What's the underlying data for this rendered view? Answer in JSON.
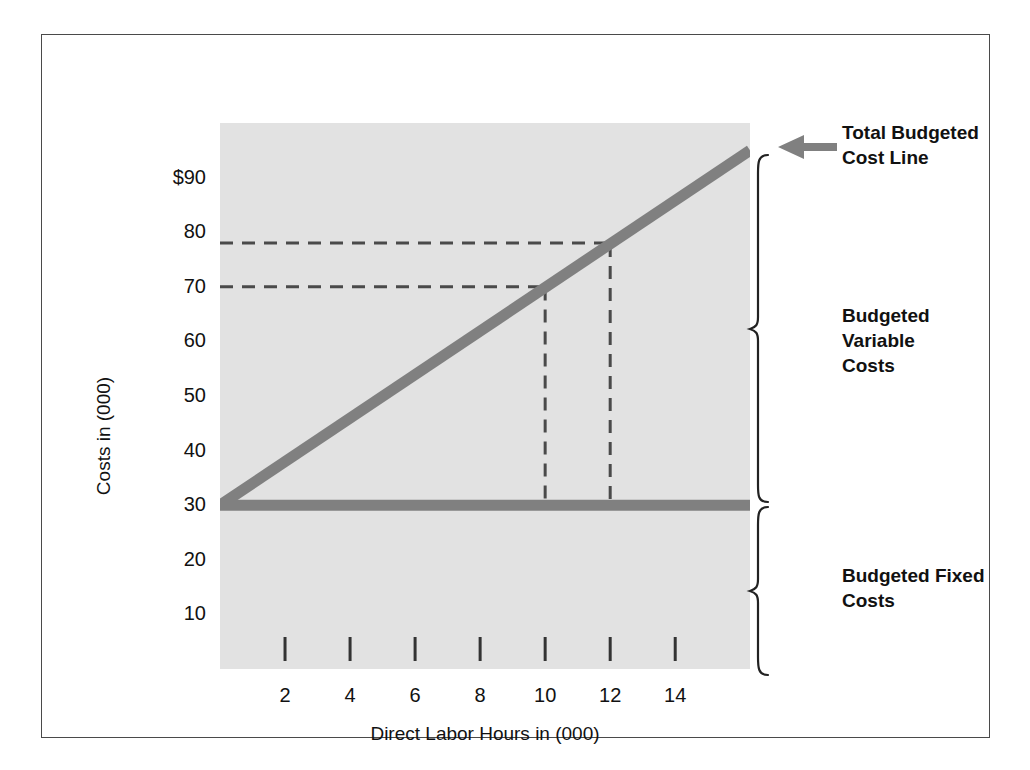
{
  "chart_data": {
    "type": "line",
    "title": "",
    "xlabel": "Direct Labor Hours in (000)",
    "ylabel": "Costs in (000)",
    "xlim": [
      0,
      16.3
    ],
    "ylim": [
      0,
      100
    ],
    "grid": false,
    "legend_position": "right-annotations",
    "x_tick_labels": [
      "2",
      "4",
      "6",
      "8",
      "10",
      "12",
      "14"
    ],
    "x_tick_values": [
      2,
      4,
      6,
      8,
      10,
      12,
      14
    ],
    "y_tick_labels": [
      "$90",
      "80",
      "70",
      "60",
      "50",
      "40",
      "30",
      "20",
      "10"
    ],
    "y_tick_values": [
      90,
      80,
      70,
      60,
      50,
      40,
      30,
      20,
      10
    ],
    "series": [
      {
        "name": "Total Budgeted Cost Line",
        "kind": "line",
        "x": [
          0,
          16.3
        ],
        "values": [
          30,
          95
        ],
        "note": "slope 4 per 1000 DLH; intercept 30"
      },
      {
        "name": "Budgeted Fixed Costs",
        "kind": "line",
        "x": [
          0,
          16.3
        ],
        "values": [
          30,
          30
        ],
        "note": "constant 30"
      }
    ],
    "annotations": [
      {
        "name": "leader-point-10",
        "x": 10,
        "y": 70,
        "style": "dashed"
      },
      {
        "name": "leader-point-12",
        "x": 12,
        "y": 78,
        "style": "dashed"
      }
    ],
    "reference_lines": {
      "horizontal_dashed": [
        78,
        70
      ],
      "vertical_dashed": [
        10,
        12
      ]
    }
  },
  "axes": {
    "y_title": "Costs in (000)",
    "x_title": "Direct Labor Hours in (000)",
    "y_ticks": [
      {
        "label": "$90",
        "value": 90
      },
      {
        "label": "80",
        "value": 80
      },
      {
        "label": "70",
        "value": 70
      },
      {
        "label": "60",
        "value": 60
      },
      {
        "label": "50",
        "value": 50
      },
      {
        "label": "40",
        "value": 40
      },
      {
        "label": "30",
        "value": 30
      },
      {
        "label": "20",
        "value": 20
      },
      {
        "label": "10",
        "value": 10
      }
    ],
    "x_ticks": [
      {
        "label": "2",
        "value": 2
      },
      {
        "label": "4",
        "value": 4
      },
      {
        "label": "6",
        "value": 6
      },
      {
        "label": "8",
        "value": 8
      },
      {
        "label": "10",
        "value": 10
      },
      {
        "label": "12",
        "value": 12
      },
      {
        "label": "14",
        "value": 14
      }
    ]
  },
  "annotations": {
    "total_cost_line": "Total Budgeted\nCost Line",
    "variable_costs": "Budgeted Variable\nCosts",
    "fixed_costs": "Budgeted Fixed\nCosts"
  },
  "colors": {
    "plot_background": "#e2e2e2",
    "page_background": "#ffffff",
    "line": "#808080",
    "dashed": "#4a4a4a",
    "text": "#111111",
    "frame": "#4a4a4a"
  }
}
